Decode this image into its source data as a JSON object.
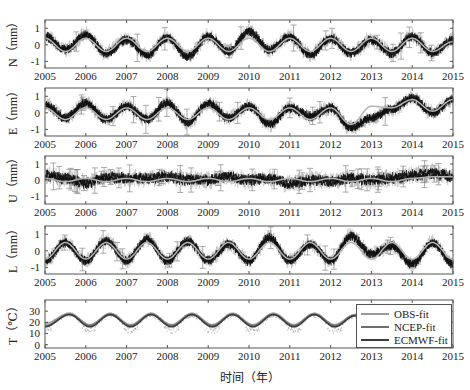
{
  "chart_data": [
    {
      "type": "line",
      "panel": "N",
      "ylabel": "N（mm）",
      "yticks": [
        -1,
        0,
        1
      ],
      "ylim": [
        -1.4,
        1.5
      ],
      "xlim": [
        2005,
        2015
      ],
      "xticks": [
        2005,
        2006,
        2007,
        2008,
        2009,
        2010,
        2011,
        2012,
        2013,
        2014,
        2015
      ],
      "series": [
        {
          "name": "observations",
          "style": "black points with gray error bars",
          "x": [
            2005.0,
            2005.5,
            2006.0,
            2006.5,
            2007.0,
            2007.5,
            2008.0,
            2008.5,
            2009.0,
            2009.5,
            2010.0,
            2010.5,
            2011.0,
            2011.5,
            2012.0,
            2012.5,
            2013.0,
            2013.5,
            2014.0,
            2014.5,
            2015.0
          ],
          "values": [
            0.5,
            -0.3,
            0.6,
            -0.5,
            0.3,
            -0.6,
            0.4,
            -0.7,
            0.5,
            -0.4,
            0.8,
            -0.3,
            0.5,
            -0.6,
            0.4,
            -0.5,
            0.3,
            -0.5,
            0.5,
            -0.5,
            0.3
          ]
        },
        {
          "name": "fit",
          "style": "light gray sinusoid",
          "x": [
            2005.0,
            2005.5,
            2006.0,
            2006.5,
            2007.0,
            2007.5,
            2008.0,
            2008.5,
            2009.0,
            2009.5,
            2010.0,
            2010.5,
            2011.0,
            2011.5,
            2012.0,
            2012.5,
            2013.0,
            2013.5,
            2014.0,
            2014.5,
            2015.0
          ],
          "values": [
            0.4,
            -0.4,
            0.4,
            -0.4,
            0.4,
            -0.4,
            0.4,
            -0.4,
            0.4,
            -0.4,
            0.4,
            -0.4,
            0.4,
            -0.4,
            0.4,
            -0.4,
            0.4,
            -0.4,
            0.4,
            -0.4,
            0.2
          ]
        }
      ]
    },
    {
      "type": "line",
      "panel": "E",
      "ylabel": "E（mm）",
      "yticks": [
        -1,
        0,
        1
      ],
      "ylim": [
        -1.4,
        1.5
      ],
      "xlim": [
        2005,
        2015
      ],
      "xticks": [
        2005,
        2006,
        2007,
        2008,
        2009,
        2010,
        2011,
        2012,
        2013,
        2014,
        2015
      ],
      "series": [
        {
          "name": "observations",
          "x": [
            2005.0,
            2005.5,
            2006.0,
            2006.5,
            2007.0,
            2007.5,
            2008.0,
            2008.5,
            2009.0,
            2009.5,
            2010.0,
            2010.5,
            2011.0,
            2011.5,
            2012.0,
            2012.5,
            2013.0,
            2013.5,
            2014.0,
            2014.5,
            2015.0
          ],
          "values": [
            0.5,
            -0.3,
            0.6,
            -0.4,
            0.4,
            -0.4,
            0.6,
            -0.6,
            0.6,
            -0.3,
            0.4,
            -0.7,
            0.3,
            -0.2,
            0.3,
            -0.9,
            -0.3,
            0.2,
            0.9,
            0.0,
            0.8
          ]
        },
        {
          "name": "fit",
          "x": [
            2005.0,
            2005.5,
            2006.0,
            2006.5,
            2007.0,
            2007.5,
            2008.0,
            2008.5,
            2009.0,
            2009.5,
            2010.0,
            2010.5,
            2011.0,
            2011.5,
            2012.0,
            2012.5,
            2013.0,
            2013.5,
            2014.0,
            2014.5,
            2015.0
          ],
          "values": [
            0.3,
            -0.4,
            0.3,
            -0.4,
            0.3,
            -0.4,
            0.3,
            -0.4,
            0.3,
            -0.4,
            0.3,
            -0.4,
            0.3,
            -0.4,
            0.3,
            -0.7,
            0.4,
            0.3,
            0.8,
            0.1,
            0.8
          ]
        }
      ]
    },
    {
      "type": "line",
      "panel": "U",
      "ylabel": "U（mm）",
      "yticks": [
        -1,
        0,
        1
      ],
      "ylim": [
        -1.5,
        1.5
      ],
      "xlim": [
        2005,
        2015
      ],
      "xticks": [
        2005,
        2006,
        2007,
        2008,
        2009,
        2010,
        2011,
        2012,
        2013,
        2014,
        2015
      ],
      "series": [
        {
          "name": "observations",
          "x": [
            2005.0,
            2005.5,
            2006.0,
            2006.5,
            2007.0,
            2007.5,
            2008.0,
            2008.5,
            2009.0,
            2009.5,
            2010.0,
            2010.5,
            2011.0,
            2011.5,
            2012.0,
            2012.5,
            2013.0,
            2013.5,
            2014.0,
            2014.5,
            2015.0
          ],
          "values": [
            0.3,
            0.1,
            -0.2,
            0.2,
            0.1,
            0.1,
            0.2,
            0.0,
            0.0,
            0.2,
            0.0,
            0.1,
            -0.2,
            0.0,
            -0.1,
            0.1,
            0.0,
            0.1,
            0.3,
            0.4,
            0.2
          ]
        },
        {
          "name": "fit",
          "x": [
            2005.0,
            2005.5,
            2006.0,
            2006.5,
            2007.0,
            2007.5,
            2008.0,
            2008.5,
            2009.0,
            2009.5,
            2010.0,
            2010.5,
            2011.0,
            2011.5,
            2012.0,
            2012.5,
            2013.0,
            2013.5,
            2014.0,
            2014.5,
            2015.0
          ],
          "values": [
            0.1,
            -0.1,
            0.1,
            -0.1,
            0.1,
            -0.1,
            0.1,
            -0.1,
            0.1,
            -0.1,
            0.1,
            -0.1,
            0.1,
            -0.1,
            0.1,
            -0.1,
            0.1,
            -0.1,
            0.1,
            0.2,
            0.2
          ]
        }
      ]
    },
    {
      "type": "line",
      "panel": "L",
      "ylabel": "L（mm）",
      "yticks": [
        -1,
        0,
        1
      ],
      "ylim": [
        -1.4,
        1.5
      ],
      "xlim": [
        2005,
        2015
      ],
      "xticks": [
        2005,
        2006,
        2007,
        2008,
        2009,
        2010,
        2011,
        2012,
        2013,
        2014,
        2015
      ],
      "series": [
        {
          "name": "observations",
          "x": [
            2005.0,
            2005.5,
            2006.0,
            2006.5,
            2007.0,
            2007.5,
            2008.0,
            2008.5,
            2009.0,
            2009.5,
            2010.0,
            2010.5,
            2011.0,
            2011.5,
            2012.0,
            2012.5,
            2013.0,
            2013.5,
            2014.0,
            2014.5,
            2015.0
          ],
          "values": [
            -0.6,
            0.5,
            -0.6,
            0.6,
            -0.6,
            0.7,
            -0.6,
            0.6,
            -0.6,
            0.4,
            -0.6,
            0.8,
            -0.6,
            0.4,
            -0.6,
            0.9,
            -0.2,
            0.3,
            -0.8,
            0.5,
            -0.8
          ]
        },
        {
          "name": "fit",
          "x": [
            2005.0,
            2005.5,
            2006.0,
            2006.5,
            2007.0,
            2007.5,
            2008.0,
            2008.5,
            2009.0,
            2009.5,
            2010.0,
            2010.5,
            2011.0,
            2011.5,
            2012.0,
            2012.5,
            2013.0,
            2013.5,
            2014.0,
            2014.5,
            2015.0
          ],
          "values": [
            -0.5,
            0.5,
            -0.5,
            0.5,
            -0.5,
            0.5,
            -0.5,
            0.5,
            -0.5,
            0.5,
            -0.5,
            0.5,
            -0.5,
            0.5,
            -0.5,
            0.5,
            -0.5,
            0.5,
            -0.5,
            0.5,
            -0.5
          ]
        }
      ]
    },
    {
      "type": "line",
      "panel": "T",
      "ylabel": "T（℃）",
      "yticks": [
        0,
        10,
        20,
        30
      ],
      "ylim": [
        -3,
        40
      ],
      "xlim": [
        2005,
        2015
      ],
      "xticks": [
        2005,
        2006,
        2007,
        2008,
        2009,
        2010,
        2011,
        2012,
        2013,
        2014,
        2015
      ],
      "legend": {
        "position": "upper right",
        "entries": [
          "OBS-fit",
          "NCEP-fit",
          "ECMWF-fit"
        ]
      },
      "series": [
        {
          "name": "OBS-fit",
          "color": "#9a9a9a",
          "x": [
            2005.0,
            2005.6,
            2006.1,
            2006.6,
            2007.1,
            2007.6,
            2008.1,
            2008.6,
            2009.1,
            2009.6,
            2010.1,
            2010.6,
            2011.1,
            2011.6,
            2012.1,
            2012.6
          ],
          "values": [
            19,
            28,
            18,
            28,
            18,
            28,
            18,
            28,
            18,
            28,
            18,
            28,
            18,
            28,
            18,
            27
          ]
        },
        {
          "name": "NCEP-fit",
          "color": "#6e6e6e",
          "x": [
            2005.0,
            2005.6,
            2006.1,
            2006.6,
            2007.1,
            2007.6,
            2008.1,
            2008.6,
            2009.1,
            2009.6,
            2010.1,
            2010.6,
            2011.1,
            2011.6,
            2012.1,
            2012.6
          ],
          "values": [
            17,
            27,
            17,
            27,
            17,
            27,
            17,
            27,
            17,
            27,
            17,
            27,
            17,
            27,
            17,
            26
          ]
        },
        {
          "name": "ECMWF-fit",
          "color": "#3c3c3c",
          "x": [
            2005.0,
            2005.6,
            2006.1,
            2006.6,
            2007.1,
            2007.6,
            2008.1,
            2008.6,
            2009.1,
            2009.6,
            2010.1,
            2010.6,
            2011.1,
            2011.6,
            2012.1,
            2012.6
          ],
          "values": [
            16,
            27,
            16,
            27,
            16,
            27,
            16,
            27,
            16,
            27,
            16,
            27,
            16,
            27,
            16,
            26
          ]
        }
      ]
    }
  ],
  "figure": {
    "xlabel": "时间（年）",
    "xtick_labels": [
      "2005",
      "2006",
      "2007",
      "2008",
      "2009",
      "2010",
      "2011",
      "2012",
      "2013",
      "2014",
      "2015"
    ],
    "panels": [
      {
        "id": "N",
        "ylabel": "N（mm）",
        "ytick_labels": [
          "1",
          "0",
          "-1"
        ]
      },
      {
        "id": "E",
        "ylabel": "E（mm）",
        "ytick_labels": [
          "1",
          "0",
          "-1"
        ]
      },
      {
        "id": "U",
        "ylabel": "U（mm）",
        "ytick_labels": [
          "1",
          "0",
          "-1"
        ]
      },
      {
        "id": "L",
        "ylabel": "L（mm）",
        "ytick_labels": [
          "1",
          "0",
          "-1"
        ]
      },
      {
        "id": "T",
        "ylabel": "T（℃）",
        "ytick_labels": [
          "30",
          "20",
          "10",
          "0"
        ]
      }
    ],
    "legend": {
      "entries": [
        {
          "label": "OBS-fit",
          "color": "#9a9a9a"
        },
        {
          "label": "NCEP-fit",
          "color": "#6e6e6e"
        },
        {
          "label": "ECMWF-fit",
          "color": "#3c3c3c"
        }
      ]
    },
    "colors": {
      "obs": "#111111",
      "errorbar": "#a8a8a8",
      "fit": "#b4b4b4",
      "axis": "#555555"
    }
  }
}
